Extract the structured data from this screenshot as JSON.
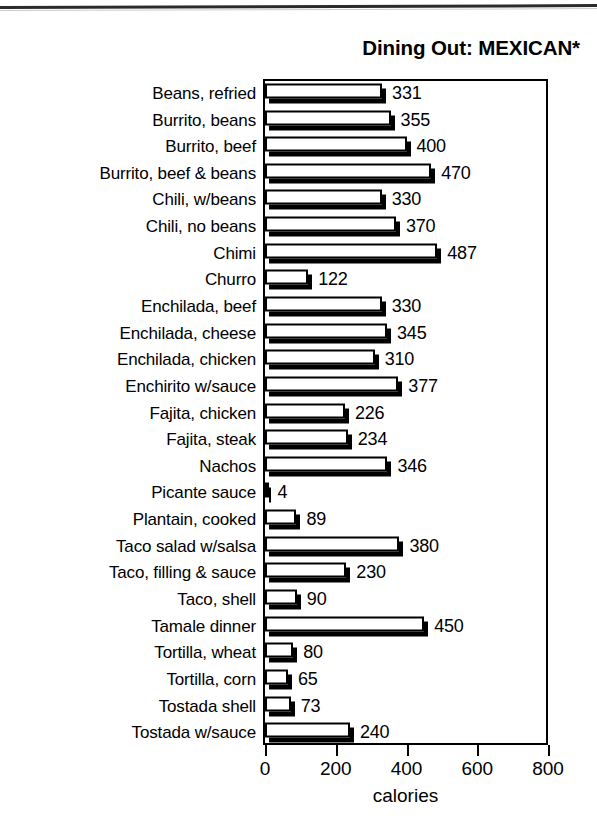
{
  "chart_data": {
    "type": "bar",
    "orientation": "horizontal",
    "title": "Dining Out: MEXICAN*",
    "xlabel": "calories",
    "ylabel": "",
    "xlim": [
      0,
      800
    ],
    "xticks": [
      0,
      200,
      400,
      600,
      800
    ],
    "xtick_labels": [
      "0",
      "200",
      "400",
      "600",
      "800"
    ],
    "grid": false,
    "legend": false,
    "bar_style": {
      "fill": "#ffffff",
      "edge": "#000000",
      "shadow": "#000000"
    },
    "categories": [
      "Beans, refried",
      "Burrito, beans",
      "Burrito, beef",
      "Burrito, beef & beans",
      "Chili, w/beans",
      "Chili, no beans",
      "Chimi",
      "Churro",
      "Enchilada, beef",
      "Enchilada, cheese",
      "Enchilada, chicken",
      "Enchirito w/sauce",
      "Fajita, chicken",
      "Fajita, steak",
      "Nachos",
      "Picante sauce",
      "Plantain, cooked",
      "Taco salad w/salsa",
      "Taco, filling & sauce",
      "Taco, shell",
      "Tamale dinner",
      "Tortilla, wheat",
      "Tortilla, corn",
      "Tostada shell",
      "Tostada w/sauce"
    ],
    "values": [
      331,
      355,
      400,
      470,
      330,
      370,
      487,
      122,
      330,
      345,
      310,
      377,
      226,
      234,
      346,
      4,
      89,
      380,
      230,
      90,
      450,
      80,
      65,
      73,
      240
    ],
    "value_labels": [
      "331",
      "355",
      "400",
      "470",
      "330",
      "370",
      "487",
      "122",
      "330",
      "345",
      "310",
      "377",
      "226",
      "234",
      "346",
      "4",
      "89",
      "380",
      "230",
      "90",
      "450",
      "80",
      "65",
      "73",
      "240"
    ]
  },
  "artifacts": {
    "top_rule": "scan-line"
  }
}
